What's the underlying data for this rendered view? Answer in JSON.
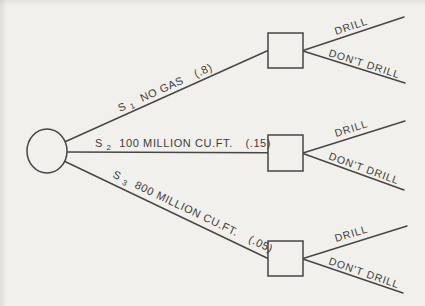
{
  "figure": {
    "type": "decision-tree",
    "paper_color": "#f2f0ec",
    "ink_color": "#474645"
  },
  "tree": {
    "root_node_shape": "circle",
    "decision_node_shape": "square",
    "branches": [
      {
        "state_letter": "S",
        "state_subscript": "1",
        "state_label": "NO GAS",
        "probability": "(.8)",
        "actions": [
          {
            "label": "DRILL"
          },
          {
            "label": "DON'T DRILL"
          }
        ]
      },
      {
        "state_letter": "S",
        "state_subscript": "2",
        "state_label": "100 MILLION CU.FT.",
        "probability": "(.15)",
        "actions": [
          {
            "label": "DRILL"
          },
          {
            "label": "DON'T DRILL"
          }
        ]
      },
      {
        "state_letter": "S",
        "state_subscript": "3",
        "state_label": "800 MILLION CU.FT.",
        "probability": "(.05)",
        "actions": [
          {
            "label": "DRILL"
          },
          {
            "label": "DON'T DRILL"
          }
        ]
      }
    ]
  }
}
